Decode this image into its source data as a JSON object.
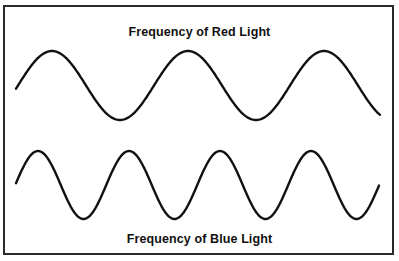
{
  "diagram": {
    "title_top": "Frequency of Red Light",
    "title_bottom": "Frequency of Blue Light",
    "colors": {
      "stroke": "#111111",
      "border": "#2a2a2a",
      "background": "#ffffff"
    },
    "waves": [
      {
        "name": "red-light-wave",
        "label": "Frequency of Red Light",
        "cycles_shown": 2.6,
        "relative_frequency": "lower"
      },
      {
        "name": "blue-light-wave",
        "label": "Frequency of Blue Light",
        "cycles_shown": 4.1,
        "relative_frequency": "higher"
      }
    ]
  }
}
